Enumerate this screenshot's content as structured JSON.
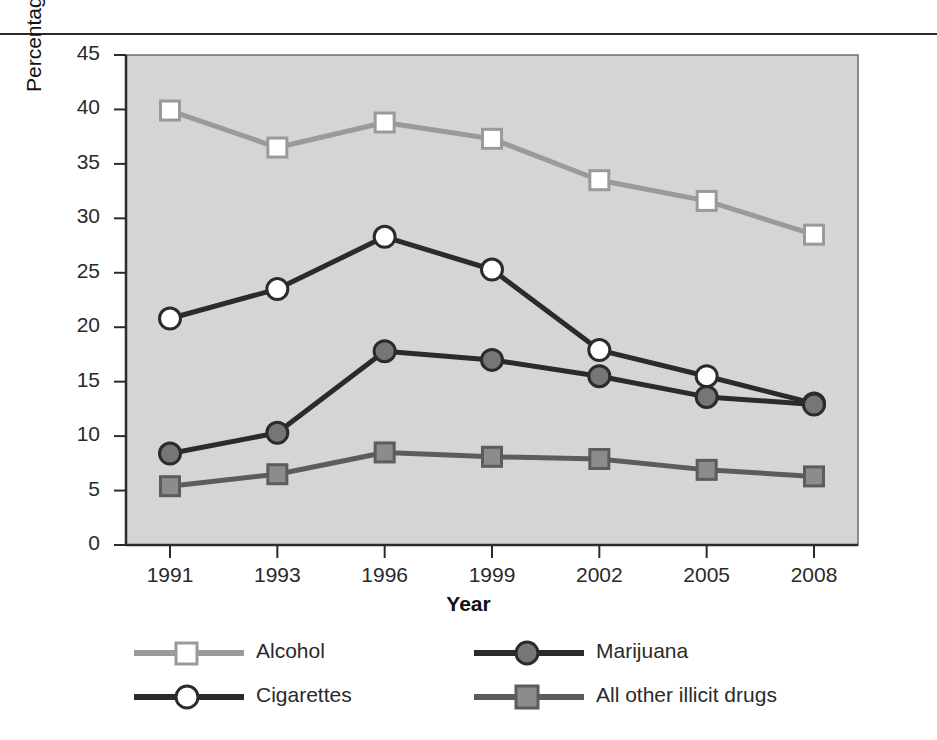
{
  "chart_data": {
    "type": "line",
    "title": "",
    "xlabel": "Year",
    "ylabel": "Percentage who've used in past 30 days",
    "categories": [
      "1991",
      "1993",
      "1996",
      "1999",
      "2002",
      "2005",
      "2008"
    ],
    "xtick_labels": [
      "1991",
      "1993",
      "1996",
      "1999",
      "2002",
      "2005",
      "2008"
    ],
    "ytick_labels": [
      "0",
      "5",
      "10",
      "15",
      "20",
      "25",
      "30",
      "35",
      "40",
      "45"
    ],
    "ylim": [
      0,
      45
    ],
    "ytick_step": 5,
    "grid": false,
    "legend_position": "below-plot",
    "plot_background": "#d5d5d5",
    "series": [
      {
        "name": "Alcohol",
        "marker": "square-open",
        "color": "#9a9a9a",
        "marker_fill": "#ffffff",
        "values": [
          39.9,
          36.5,
          38.8,
          37.3,
          33.5,
          31.6,
          28.5
        ]
      },
      {
        "name": "Cigarettes",
        "marker": "circle-open",
        "color": "#2b2b2b",
        "marker_fill": "#ffffff",
        "values": [
          20.8,
          23.5,
          28.3,
          25.3,
          17.9,
          15.5,
          13.0
        ]
      },
      {
        "name": "Marijuana",
        "marker": "circle-filled",
        "color": "#2b2b2b",
        "marker_fill": "#767676",
        "values": [
          8.4,
          10.3,
          17.8,
          17.0,
          15.5,
          13.6,
          12.9
        ]
      },
      {
        "name": "All other illicit drugs",
        "marker": "square-filled",
        "color": "#5c5c5c",
        "marker_fill": "#8c8c8c",
        "values": [
          5.4,
          6.5,
          8.5,
          8.1,
          7.9,
          6.9,
          6.3
        ]
      }
    ]
  },
  "legend": {
    "items": [
      {
        "label": "Alcohol"
      },
      {
        "label": "Marijuana"
      },
      {
        "label": "Cigarettes"
      },
      {
        "label": "All other illicit drugs"
      }
    ]
  }
}
